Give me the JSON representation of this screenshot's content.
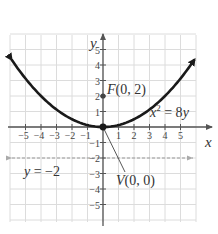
{
  "chart_data": {
    "type": "line",
    "title": "",
    "equation": "x^2 = 8y",
    "xlabel": "x",
    "ylabel": "y",
    "xlim": [
      -6,
      6
    ],
    "ylim": [
      -6,
      6
    ],
    "grid": true,
    "x_ticks": [
      -5,
      -4,
      -3,
      -2,
      -1,
      1,
      2,
      3,
      4,
      5
    ],
    "y_ticks": [
      -5,
      -4,
      -3,
      -2,
      -1,
      1,
      2,
      3,
      4,
      5
    ],
    "series": [
      {
        "name": "x^2 = 8y",
        "x": [
          -6,
          -5,
          -4,
          -3,
          -2,
          -1,
          0,
          1,
          2,
          3,
          4,
          5,
          6
        ],
        "y": [
          4.5,
          3.125,
          2,
          1.125,
          0.5,
          0.125,
          0,
          0.125,
          0.5,
          1.125,
          2,
          3.125,
          4.5
        ]
      }
    ],
    "annotations": [
      {
        "type": "point",
        "label": "F(0, 2)",
        "x": 0,
        "y": 2,
        "meaning": "focus"
      },
      {
        "type": "point",
        "label": "V(0, 0)",
        "x": 0,
        "y": 0,
        "meaning": "vertex"
      },
      {
        "type": "dashed-line",
        "label": "y = −2",
        "y": -2,
        "meaning": "directrix"
      }
    ]
  },
  "labels": {
    "x_axis": "x",
    "y_axis": "y",
    "equation_lhs": "x",
    "equation_exp": "2",
    "equation_rhs": " = 8y",
    "focus": "F(0, 2)",
    "vertex": "V(0, 0)",
    "directrix": "y = −2"
  },
  "colors": {
    "grid": "#dcdcdc",
    "axis": "#555555",
    "curve": "#1a1a1a",
    "directrix": "#999999",
    "text": "#333333"
  }
}
